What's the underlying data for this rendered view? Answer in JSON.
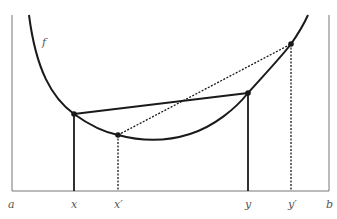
{
  "diagram": {
    "function_label": "f",
    "axis_labels": {
      "a": "a",
      "x": "x",
      "x_prime": "x′",
      "y": "y",
      "y_prime": "y′",
      "b": "b"
    },
    "colors": {
      "line": "#1a1a1a",
      "frame": "#777777",
      "label": "#555555",
      "background": "#ffffff"
    },
    "points": [
      {
        "name": "x",
        "px": 74,
        "py": 114
      },
      {
        "name": "x_prime",
        "px": 118,
        "py": 135
      },
      {
        "name": "y",
        "px": 248,
        "py": 93
      },
      {
        "name": "y_prime",
        "px": 291,
        "py": 44
      }
    ],
    "chords": [
      {
        "from": "x",
        "to": "y",
        "style": "solid"
      },
      {
        "from": "x_prime",
        "to": "y_prime",
        "style": "dotted"
      }
    ]
  }
}
